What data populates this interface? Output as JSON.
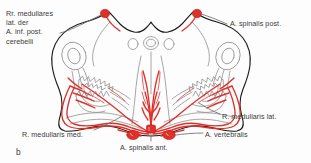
{
  "figure": {
    "letter": "b",
    "caption_letter": "b",
    "type": "anatomical-cross-section",
    "colors": {
      "artery_red": "#e0302a",
      "outline_black": "#1c1c1c",
      "internal_gray": "#8a8a8a",
      "leader_line": "#6f6f6f",
      "text": "#3b3b3b",
      "background": "#fdfdfd"
    }
  },
  "labels": {
    "posterior_inferior_cerebellar_branches": "Rr. medullares\nlat. der\nA. inf. post.\ncerebelli",
    "posterior_spinal_artery": "A. spinalis post.",
    "lateral_medullary_branch": "R. medullaris lat.",
    "vertebral_artery": "A. vertebralis",
    "medial_medullary_branch": "R. medullaris med.",
    "anterior_spinal_artery": "A. spinalis ant."
  },
  "structures": [
    {
      "name": "posterior-spinal-artery-left",
      "type": "vessel-dot",
      "side": "left"
    },
    {
      "name": "posterior-spinal-artery-right",
      "type": "vessel-dot",
      "side": "right"
    },
    {
      "name": "vertebral-artery-left",
      "type": "vessel-dot",
      "side": "left"
    },
    {
      "name": "vertebral-artery-right",
      "type": "vessel-dot",
      "side": "right"
    },
    {
      "name": "anterior-spinal-artery",
      "type": "vessel-dot",
      "side": "midline"
    },
    {
      "name": "inferior-olivary-nucleus-left",
      "type": "nucleus",
      "side": "left"
    },
    {
      "name": "inferior-olivary-nucleus-right",
      "type": "nucleus",
      "side": "right"
    },
    {
      "name": "pyramid-left",
      "type": "tract",
      "side": "left"
    },
    {
      "name": "pyramid-right",
      "type": "tract",
      "side": "right"
    },
    {
      "name": "anterior-median-fissure",
      "type": "fissure",
      "side": "midline"
    },
    {
      "name": "central-canal",
      "type": "canal",
      "side": "midline"
    }
  ]
}
